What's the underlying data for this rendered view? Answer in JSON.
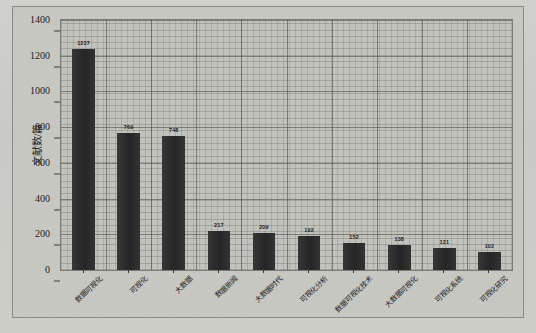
{
  "chart_data": {
    "type": "bar",
    "title": "",
    "subtitle": "",
    "xlabel": "",
    "ylabel": "文献数/篇",
    "ylim": [
      0,
      1400
    ],
    "ytick_labels": [
      "0",
      "200",
      "400",
      "600",
      "800",
      "1000",
      "1200",
      "1400"
    ],
    "ytick_values": [
      0,
      200,
      400,
      600,
      800,
      1000,
      1200,
      1400
    ],
    "grid": true,
    "legend": "none",
    "categories": [
      "数据可视化",
      "可视化",
      "大数据",
      "数据新闻",
      "大数据时代",
      "可视化分析",
      "数据可视化技术",
      "大数据可视化",
      "可视化系统",
      "可视化研究"
    ],
    "values": [
      1237,
      769,
      748,
      217,
      209,
      192,
      152,
      138,
      121,
      102
    ],
    "value_labels": [
      "1237",
      "769",
      "748",
      "217",
      "209",
      "192",
      "152",
      "138",
      "121",
      "102"
    ],
    "bar_color": "#2f2f2f",
    "plot_background": "#c4c4bf",
    "page_background": "#cfcfcb"
  }
}
